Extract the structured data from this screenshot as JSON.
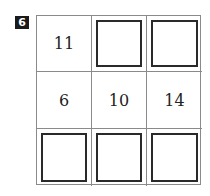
{
  "badge": "6",
  "grid": {
    "rows": [
      [
        {
          "value": "11",
          "blank": false
        },
        {
          "value": "",
          "blank": true
        },
        {
          "value": "",
          "blank": true
        }
      ],
      [
        {
          "value": "6",
          "blank": false
        },
        {
          "value": "10",
          "blank": false
        },
        {
          "value": "14",
          "blank": false
        }
      ],
      [
        {
          "value": "",
          "blank": true
        },
        {
          "value": "",
          "blank": true
        },
        {
          "value": "",
          "blank": true
        }
      ]
    ]
  }
}
